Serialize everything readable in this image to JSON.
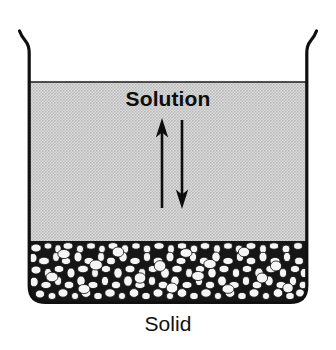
{
  "figure": {
    "labels": {
      "solution": "Solution",
      "solid": "Solid"
    },
    "icons": {
      "beaker": "beaker-icon",
      "up_arrow": "arrow-up-icon",
      "down_arrow": "arrow-down-icon",
      "solution_fill": "halftone-gray-fill",
      "solid_bed": "granular-particles-fill"
    },
    "colors": {
      "outline": "#101010",
      "solution_fill": "#c9c9c9",
      "solid_dark": "#141414",
      "particle_light": "#f4f4f4",
      "background": "#ffffff",
      "text": "#0d0d0d"
    },
    "geometry": {
      "beaker_left_x": 28,
      "beaker_right_x": 308,
      "rim_top_y": 30,
      "liquid_surface_y": 82,
      "solid_top_y": 241,
      "beaker_bottom_y": 303,
      "arrow_up_x": 162,
      "arrow_down_x": 182,
      "arrow_top_y": 120,
      "arrow_bottom_y": 208
    }
  }
}
